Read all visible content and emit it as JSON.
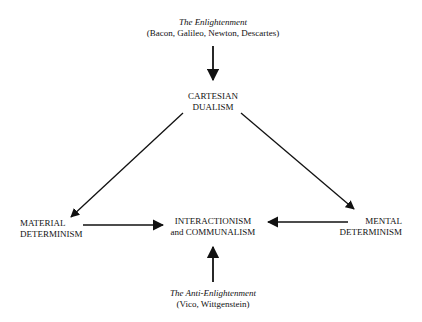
{
  "diagram": {
    "nodes": {
      "enlightenment": {
        "title": "The Enlightenment",
        "subtitle": "(Bacon, Galileo, Newton, Descartes)"
      },
      "cartesian": {
        "line1": "CARTESIAN",
        "line2": "DUALISM"
      },
      "material": {
        "line1": "MATERIAL",
        "line2": "DETERMINISM"
      },
      "interaction": {
        "line1": "INTERACTIONISM",
        "line2": "and COMMUNALISM"
      },
      "mental": {
        "line1": "MENTAL",
        "line2": "DETERMINISM"
      },
      "anti_enlightenment": {
        "title": "The Anti-Enlightenment",
        "subtitle": "(Vico, Wittgenstein)"
      }
    },
    "edges": [
      {
        "from": "enlightenment",
        "to": "cartesian"
      },
      {
        "from": "cartesian",
        "to": "material"
      },
      {
        "from": "cartesian",
        "to": "mental"
      },
      {
        "from": "material",
        "to": "interaction"
      },
      {
        "from": "mental",
        "to": "interaction"
      },
      {
        "from": "anti_enlightenment",
        "to": "interaction"
      }
    ]
  }
}
